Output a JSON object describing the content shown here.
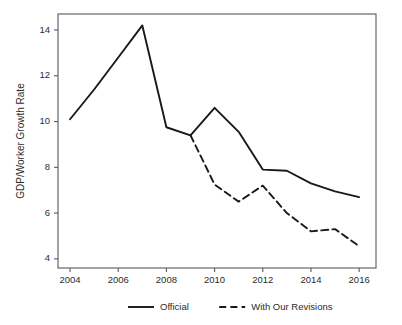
{
  "chart_data": {
    "type": "line",
    "title": "",
    "subtitle": "",
    "xlabel": "",
    "ylabel": "GDP/Worker Growth Rate",
    "x": [
      2004,
      2005,
      2006,
      2007,
      2008,
      2009,
      2010,
      2011,
      2012,
      2013,
      2014,
      2015,
      2016
    ],
    "xlim": [
      2003.5,
      2016.7
    ],
    "ylim": [
      3.6,
      14.7
    ],
    "xticks": [
      2004,
      2006,
      2008,
      2010,
      2012,
      2014,
      2016
    ],
    "xtick_labels": [
      "2004",
      "2006",
      "2008",
      "2010",
      "2012",
      "2014",
      "2016"
    ],
    "yticks": [
      4,
      6,
      8,
      10,
      12,
      14
    ],
    "ytick_labels": [
      "4",
      "6",
      "8",
      "10",
      "12",
      "14"
    ],
    "grid": false,
    "legend_position": "below",
    "series": [
      {
        "name": "Official",
        "style": "solid",
        "color": "#17191b",
        "x": [
          2004,
          2005,
          2006,
          2007,
          2008,
          2009,
          2010,
          2011,
          2012,
          2013,
          2014,
          2015,
          2016
        ],
        "values": [
          10.1,
          11.4,
          12.8,
          14.2,
          9.75,
          9.4,
          10.6,
          9.55,
          7.9,
          7.85,
          7.3,
          6.95,
          6.7
        ]
      },
      {
        "name": "With Our Revisions",
        "style": "dashed",
        "color": "#17191b",
        "x": [
          2009,
          2010,
          2011,
          2012,
          2013,
          2014,
          2015,
          2016
        ],
        "values": [
          9.4,
          7.25,
          6.5,
          7.2,
          6.0,
          5.2,
          5.3,
          4.55
        ]
      }
    ]
  },
  "legend": {
    "items": [
      {
        "label": "Official",
        "style": "solid"
      },
      {
        "label": "With Our Revisions",
        "style": "dashed"
      }
    ]
  }
}
